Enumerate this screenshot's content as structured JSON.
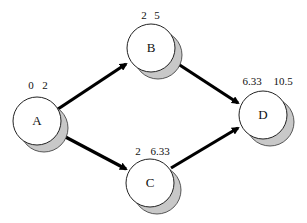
{
  "diagram": {
    "type": "activity-on-node network",
    "colors": {
      "node_fill": "#ffffff",
      "node_stroke": "#222222",
      "shadow_fill": "#c8c8c8",
      "edge": "#000000",
      "background": "#ffffff"
    },
    "nodes": [
      {
        "id": "A",
        "label": "A",
        "early": "0",
        "late": "2",
        "times": "0  2"
      },
      {
        "id": "B",
        "label": "B",
        "early": "2",
        "late": "5",
        "times": "2  5"
      },
      {
        "id": "C",
        "label": "C",
        "early": "2",
        "late": "6.33",
        "times": "2  6.33"
      },
      {
        "id": "D",
        "label": "D",
        "early": "6.33",
        "late": "10.5",
        "times": "6.33  10.5"
      }
    ],
    "edges": [
      {
        "from": "A",
        "to": "B"
      },
      {
        "from": "A",
        "to": "C"
      },
      {
        "from": "B",
        "to": "D"
      },
      {
        "from": "C",
        "to": "D"
      }
    ]
  }
}
